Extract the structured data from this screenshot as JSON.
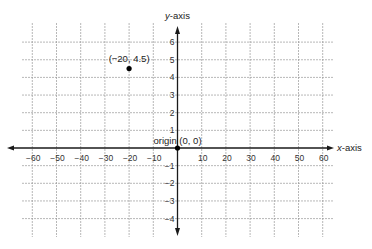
{
  "chart_data": {
    "type": "scatter",
    "title": "",
    "xlabel": "x-axis",
    "ylabel": "y-axis",
    "xlabel_var": "x",
    "xlabel_rest": "-axis",
    "ylabel_var": "y",
    "ylabel_rest": "-axis",
    "xlim": [
      -60,
      60
    ],
    "ylim": [
      -4,
      6
    ],
    "grid": true,
    "x_ticks": [
      -60,
      -50,
      -40,
      -30,
      -20,
      -10,
      10,
      20,
      30,
      40,
      50,
      60
    ],
    "x_tick_labels": [
      "−60",
      "−50",
      "−40",
      "−30",
      "−20",
      "−10",
      "10",
      "20",
      "30",
      "40",
      "50",
      "60"
    ],
    "y_ticks": [
      6,
      5,
      4,
      3,
      2,
      1,
      -1,
      -2,
      -3,
      -4
    ],
    "y_tick_labels": [
      "6",
      "5",
      "4",
      "3",
      "2",
      "1",
      "−1",
      "−2",
      "−3",
      "−4"
    ],
    "points": [
      {
        "name": "point-neg20-4p5",
        "x": -20,
        "y": 4.5,
        "label": "(−20, 4.5)"
      },
      {
        "name": "origin-point",
        "x": 0,
        "y": 0,
        "label": "origin  (0, 0)"
      }
    ],
    "colors": {
      "axis": "#1a1a1a",
      "grid": "#9a9a9a",
      "point": "#000000",
      "text": "#222222"
    }
  }
}
